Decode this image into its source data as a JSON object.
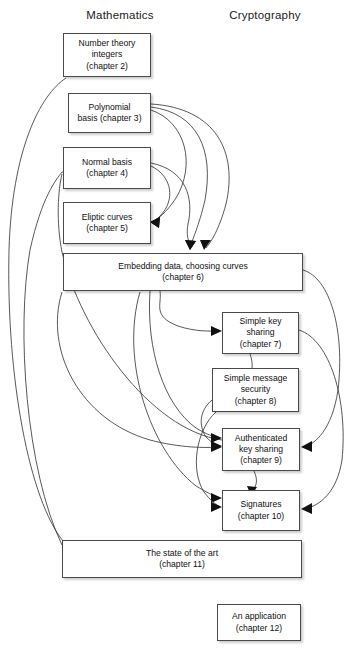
{
  "figure": {
    "type": "flow-diagram",
    "title_headers": [
      {
        "id": "math",
        "label": "Mathematics",
        "x": 120,
        "y": 20
      },
      {
        "id": "crypto",
        "label": "Cryptography",
        "x": 265,
        "y": 20
      }
    ],
    "nodes": [
      {
        "id": "ch2",
        "label": "Number theory\nintegers\n(chapter 2)",
        "x": 63,
        "y": 33,
        "w": 88,
        "h": 44,
        "column": "Mathematics"
      },
      {
        "id": "ch3",
        "label": "Polynomial\nbasis (chapter 3)",
        "x": 68,
        "y": 93,
        "w": 83,
        "h": 40,
        "column": "Mathematics"
      },
      {
        "id": "ch4",
        "label": "Normal basis\n(chapter 4)",
        "x": 63,
        "y": 147,
        "w": 88,
        "h": 42,
        "column": "Mathematics"
      },
      {
        "id": "ch5",
        "label": "Eliptic curves\n(chapter 5)",
        "x": 63,
        "y": 202,
        "w": 88,
        "h": 42,
        "column": "Mathematics"
      },
      {
        "id": "ch6",
        "label": "Embedding data, choosing curves\n(chapter 6)",
        "x": 63,
        "y": 253,
        "w": 240,
        "h": 38,
        "column": "Both"
      },
      {
        "id": "ch7",
        "label": "Simple key\nsharing\n(chapter 7)",
        "x": 222,
        "y": 312,
        "w": 77,
        "h": 42,
        "column": "Cryptography"
      },
      {
        "id": "ch8",
        "label": "Simple message\nsecurity\n(chapter 8)",
        "x": 212,
        "y": 368,
        "w": 87,
        "h": 44,
        "column": "Cryptography"
      },
      {
        "id": "ch9",
        "label": "Authenticated\nkey sharing\n(chapter 9)",
        "x": 222,
        "y": 428,
        "w": 78,
        "h": 43,
        "column": "Cryptography"
      },
      {
        "id": "ch10",
        "label": "Signatures\n(chapter 10)",
        "x": 222,
        "y": 490,
        "w": 78,
        "h": 41,
        "column": "Cryptography"
      },
      {
        "id": "ch11",
        "label": "The state of the art\n(chapter 11)",
        "x": 62,
        "y": 540,
        "w": 240,
        "h": 38,
        "column": "Both"
      },
      {
        "id": "ch12",
        "label": "An application\n(chapter 12)",
        "x": 217,
        "y": 604,
        "w": 84,
        "h": 37,
        "column": "Cryptography"
      }
    ],
    "edges": [
      {
        "from": "ch11",
        "to": "ch2",
        "path": "M 63 541 C 30 500 6 380 9 250 C 12 150 40 95 66 78",
        "arrow": false
      },
      {
        "from": "ch11",
        "to": "ch4",
        "path": "M 62 545 C 26 470 16 330 30 250 C 42 196 56 180 62 172",
        "arrow": true,
        "head": "M 62 172 l 9 -5.5 l -1.5 11 z"
      },
      {
        "from": "ch9",
        "to": "ch4",
        "path": "M 222 440 C 150 430 80 330 62 252 C 56 222 58 190 62 174",
        "arrow": false
      },
      {
        "from": "ch3",
        "to": "ch5",
        "path": "M 151 110 C 186 122 196 165 176 198 C 166 213 158 219 152 222",
        "arrow": true,
        "head": "M 150 222 l 10 -5 l -1 11 z"
      },
      {
        "from": "ch4",
        "to": "ch5",
        "path": "M 151 166 C 172 176 176 200 160 216 C 157 219 154 221 152 222",
        "arrow": true,
        "head": "M 150 222 l 10 -5 l -1 11 z"
      },
      {
        "from": "ch3",
        "to": "ch6",
        "path": "M 151 107 C 198 113 214 150 205 200 C 199 226 192 240 190 248",
        "arrow": true,
        "head": "M 190 250 l -5 -10 l 11 1 z"
      },
      {
        "from": "ch4",
        "to": "ch6",
        "path": "M 151 163 C 186 170 194 198 188 224 C 186 234 188 242 192 247",
        "arrow": true,
        "head": "M 190 250 l -5 -10 l 11 1 z"
      },
      {
        "from": "ch3",
        "to": "ch6b",
        "path": "M 151 104 C 216 108 238 152 226 204 C 219 230 211 242 206 248",
        "arrow": true,
        "head": "M 204 250 l -4 -10 l 11 0 z"
      },
      {
        "from": "ch6",
        "to": "ch7",
        "path": "M 160 291 C 162 305 152 316 178 326 C 196 332 210 331 219 331",
        "arrow": true,
        "head": "M 222 331 l -11 -5 l 0 10 z"
      },
      {
        "from": "ch7",
        "to": "ch8",
        "path": "M 250 354 C 254 365 252 372 248 380",
        "arrow": true,
        "head": "M 247 384 l -4 -10 l 10 1 z"
      },
      {
        "from": "ch9",
        "to": "ch10",
        "path": "M 254 471 C 258 480 257 485 252 492",
        "arrow": true,
        "head": "M 251 496 l -4 -10 l 10 1 z"
      },
      {
        "from": "ch6",
        "to": "ch9",
        "path": "M 303 270 C 330 278 345 330 338 390 C 332 430 315 444 304 447",
        "arrow": true,
        "head": "M 301 447 l 11 -6 l 0 11 z"
      },
      {
        "from": "ch7",
        "to": "ch10",
        "path": "M 299 330 C 330 340 348 400 342 460 C 337 492 320 506 304 509",
        "arrow": true,
        "head": "M 301 509 l 11 -6 l 0 11 z"
      },
      {
        "from": "ch8",
        "to": "ch9",
        "path": "M 212 400 C 200 410 198 425 206 437 C 212 443 216 445 219 446",
        "arrow": true,
        "head": "M 222 446 l -11 -5 l 0 10 z"
      },
      {
        "from": "ch6",
        "to": "ch9b",
        "path": "M 150 291 C 146 350 164 405 196 428 C 206 434 214 437 219 438",
        "arrow": true,
        "head": "M 222 438 l -11 -5 l 0 10 z"
      },
      {
        "from": "ch6",
        "to": "ch10",
        "path": "M 140 292 C 120 360 150 450 196 486 C 206 492 214 496 219 498",
        "arrow": true,
        "head": "M 222 498 l -11 -5 l 0 10 z"
      },
      {
        "from": "ch8",
        "to": "ch10",
        "path": "M 216 412 C 196 430 190 470 204 492 C 210 500 216 505 219 506",
        "arrow": true,
        "head": "M 222 507 l -11 -5 l 0 10 z"
      },
      {
        "from": "ch6",
        "to": "ch9c",
        "path": "M 62 292 C 44 350 80 420 150 440 C 180 448 206 448 219 447",
        "arrow": true,
        "head": "M 222 447 l -11 -5 l 0 10 z"
      }
    ]
  }
}
